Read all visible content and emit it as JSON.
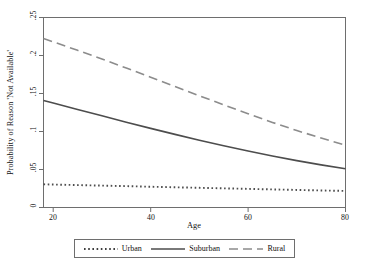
{
  "chart_data": {
    "type": "line",
    "title": "",
    "xlabel": "Age",
    "ylabel": "Probability of Reason 'Not Available'",
    "xlim": [
      18,
      80
    ],
    "ylim": [
      0,
      0.25
    ],
    "grid": false,
    "legend_position": "bottom",
    "xticks": [
      "20",
      "40",
      "60",
      "80"
    ],
    "xtick_values": [
      20,
      40,
      60,
      80
    ],
    "yticks": [
      "0",
      ".05",
      ".1",
      ".15",
      ".2",
      ".25"
    ],
    "ytick_values": [
      0,
      0.05,
      0.1,
      0.15,
      0.2,
      0.25
    ],
    "x": [
      18,
      20,
      25,
      30,
      35,
      40,
      45,
      50,
      55,
      60,
      65,
      70,
      75,
      80
    ],
    "series": [
      {
        "name": "Urban",
        "style": "dotted",
        "color": "#4d4d4d",
        "values": [
          0.0305,
          0.0302,
          0.0295,
          0.0288,
          0.0281,
          0.0273,
          0.0266,
          0.0259,
          0.0252,
          0.0245,
          0.0238,
          0.0231,
          0.0224,
          0.0218
        ]
      },
      {
        "name": "Suburban",
        "style": "solid",
        "color": "#4d4d4d",
        "values": [
          0.1408,
          0.1374,
          0.129,
          0.1206,
          0.1123,
          0.1041,
          0.0962,
          0.0885,
          0.0812,
          0.0743,
          0.0678,
          0.0617,
          0.0561,
          0.051
        ]
      },
      {
        "name": "Rural",
        "style": "dashed",
        "color": "#8c8c8c",
        "values": [
          0.2224,
          0.218,
          0.2068,
          0.1953,
          0.1835,
          0.1714,
          0.1592,
          0.147,
          0.135,
          0.1233,
          0.112,
          0.1013,
          0.0913,
          0.082
        ]
      }
    ]
  },
  "axes": {
    "y_title": "Probability of Reason 'Not Available'",
    "x_title": "Age"
  },
  "legend": {
    "items": [
      {
        "label": "Urban"
      },
      {
        "label": "Suburban"
      },
      {
        "label": "Rural"
      }
    ]
  }
}
